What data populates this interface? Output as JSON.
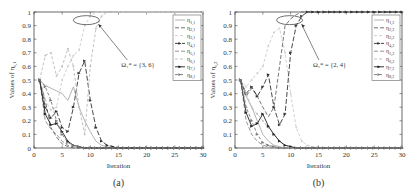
{
  "chart_data": [
    {
      "type": "line",
      "panel_label": "(a)",
      "xlabel": "Iteration",
      "ylabel": "Values of η_{i,1}",
      "xlim": [
        0,
        30
      ],
      "ylim": [
        0,
        1
      ],
      "xticks": [
        0,
        5,
        10,
        15,
        20,
        25,
        30
      ],
      "yticks": [
        0,
        0.1,
        0.2,
        0.3,
        0.4,
        0.5,
        0.6,
        0.7,
        0.8,
        0.9,
        1
      ],
      "grid": false,
      "legend_position": "upper right",
      "annotation": "Ω₁* = {3, 6}",
      "x": [
        1,
        2,
        3,
        4,
        5,
        6,
        7,
        8,
        9,
        10,
        11,
        12,
        13,
        14,
        15,
        16,
        17,
        18,
        19,
        20,
        21,
        22,
        23,
        24,
        25,
        26,
        27,
        28,
        29,
        30
      ],
      "series": [
        {
          "name": "η_{1,1}",
          "color": "#aaaaaa",
          "dash": "",
          "values": [
            0.5,
            0.46,
            0.44,
            0.42,
            0.4,
            0.35,
            0.45,
            0.3,
            0.2,
            0.12,
            0.05,
            0.02,
            0.01,
            0,
            0,
            0,
            0,
            0,
            0,
            0,
            0,
            0,
            0,
            0,
            0,
            0,
            0,
            0,
            0,
            0
          ]
        },
        {
          "name": "η_{2,1}",
          "color": "#666666",
          "dash": "4,2",
          "values": [
            0.5,
            0.35,
            0.15,
            0.08,
            0.03,
            0.01,
            0,
            0,
            0,
            0,
            0,
            0,
            0,
            0,
            0,
            0,
            0,
            0,
            0,
            0,
            0,
            0,
            0,
            0,
            0,
            0,
            0,
            0,
            0,
            0
          ]
        },
        {
          "name": "η_{3,1}",
          "color": "#cccccc",
          "dash": "3,2",
          "values": [
            0.5,
            0.35,
            0.28,
            0.3,
            0.5,
            0.6,
            0.68,
            0.72,
            0.9,
            0.97,
            1,
            1,
            1,
            1,
            1,
            1,
            1,
            1,
            1,
            1,
            1,
            1,
            1,
            1,
            1,
            1,
            1,
            1,
            1,
            1
          ]
        },
        {
          "name": "η_{4,1}",
          "color": "#333333",
          "dash": "5,2",
          "values": [
            0.5,
            0.3,
            0.22,
            0.27,
            0.15,
            0.12,
            0.3,
            0.55,
            0.64,
            0.35,
            0.15,
            0.05,
            0.02,
            0.01,
            0,
            0,
            0,
            0,
            0,
            0,
            0,
            0,
            0,
            0,
            0,
            0,
            0,
            0,
            0,
            0
          ]
        },
        {
          "name": "η_{5,1}",
          "color": "#888888",
          "dash": "4,2",
          "values": [
            0.5,
            0.2,
            0.14,
            0.1,
            0.05,
            0.02,
            0.01,
            0,
            0,
            0,
            0,
            0,
            0,
            0,
            0,
            0,
            0,
            0,
            0,
            0,
            0,
            0,
            0,
            0,
            0,
            0,
            0,
            0,
            0,
            0
          ]
        },
        {
          "name": "η_{6,1}",
          "color": "#bbbbbb",
          "dash": "3,2",
          "values": [
            0.5,
            0.68,
            0.7,
            0.53,
            0.6,
            0.73,
            0.6,
            0.3,
            0.1,
            0.6,
            0.88,
            0.97,
            1,
            1,
            1,
            1,
            1,
            1,
            1,
            1,
            1,
            1,
            1,
            1,
            1,
            1,
            1,
            1,
            1,
            1
          ]
        },
        {
          "name": "η_{7,1}",
          "color": "#222222",
          "dash": "",
          "values": [
            0.5,
            0.25,
            0.17,
            0.18,
            0.12,
            0.05,
            0.02,
            0.01,
            0,
            0,
            0,
            0,
            0,
            0,
            0,
            0,
            0,
            0,
            0,
            0,
            0,
            0,
            0,
            0,
            0,
            0,
            0,
            0,
            0,
            0
          ]
        },
        {
          "name": "η_{8,1}",
          "color": "#777777",
          "dash": "3,2",
          "values": [
            0.5,
            0.45,
            0.35,
            0.2,
            0.1,
            0.04,
            0.02,
            0.01,
            0,
            0,
            0,
            0,
            0,
            0,
            0,
            0,
            0,
            0,
            0,
            0,
            0,
            0,
            0,
            0,
            0,
            0,
            0,
            0,
            0,
            0
          ]
        }
      ]
    },
    {
      "type": "line",
      "panel_label": "(b)",
      "xlabel": "Iteration",
      "ylabel": "Values of η_{i,2}",
      "xlim": [
        0,
        30
      ],
      "ylim": [
        0,
        1
      ],
      "xticks": [
        0,
        5,
        10,
        15,
        20,
        25,
        30
      ],
      "yticks": [
        0,
        0.1,
        0.2,
        0.3,
        0.4,
        0.5,
        0.6,
        0.7,
        0.8,
        0.9,
        1
      ],
      "grid": false,
      "legend_position": "upper right",
      "annotation": "Ω₂* = {2, 4}",
      "x": [
        1,
        2,
        3,
        4,
        5,
        6,
        7,
        8,
        9,
        10,
        11,
        12,
        13,
        14,
        15,
        16,
        17,
        18,
        19,
        20,
        21,
        22,
        23,
        24,
        25,
        26,
        27,
        28,
        29,
        30
      ],
      "series": [
        {
          "name": "η_{1,2}",
          "color": "#aaaaaa",
          "dash": "",
          "values": [
            0.5,
            0.38,
            0.3,
            0.2,
            0.1,
            0.05,
            0.02,
            0.01,
            0,
            0,
            0,
            0,
            0,
            0,
            0,
            0,
            0,
            0,
            0,
            0,
            0,
            0,
            0,
            0,
            0,
            0,
            0,
            0,
            0,
            0
          ]
        },
        {
          "name": "η_{2,2}",
          "color": "#666666",
          "dash": "4,2",
          "values": [
            0.5,
            0.38,
            0.44,
            0.38,
            0.3,
            0.23,
            0.3,
            0.6,
            0.9,
            0.95,
            0.98,
            1,
            1,
            1,
            1,
            1,
            1,
            1,
            1,
            1,
            1,
            1,
            1,
            1,
            1,
            1,
            1,
            1,
            1,
            1
          ]
        },
        {
          "name": "η_{3,2}",
          "color": "#cccccc",
          "dash": "3,2",
          "values": [
            0.5,
            0.45,
            0.5,
            0.55,
            0.6,
            0.75,
            0.85,
            0.88,
            0.7,
            0.4,
            0.15,
            0.05,
            0.02,
            0.01,
            0,
            0,
            0,
            0,
            0,
            0,
            0,
            0,
            0,
            0,
            0,
            0,
            0,
            0,
            0,
            0
          ]
        },
        {
          "name": "η_{4,2}",
          "color": "#333333",
          "dash": "5,2",
          "values": [
            0.5,
            0.4,
            0.45,
            0.38,
            0.45,
            0.54,
            0.3,
            0.17,
            0.25,
            0.7,
            0.9,
            0.97,
            1,
            1,
            1,
            1,
            1,
            1,
            1,
            1,
            1,
            1,
            1,
            1,
            1,
            1,
            1,
            1,
            1,
            1
          ]
        },
        {
          "name": "η_{5,2}",
          "color": "#888888",
          "dash": "4,2",
          "values": [
            0.5,
            0.2,
            0.1,
            0.05,
            0.02,
            0.01,
            0,
            0,
            0,
            0,
            0,
            0,
            0,
            0,
            0,
            0,
            0,
            0,
            0,
            0,
            0,
            0,
            0,
            0,
            0,
            0,
            0,
            0,
            0,
            0
          ]
        },
        {
          "name": "η_{6,2}",
          "color": "#bbbbbb",
          "dash": "3,2",
          "values": [
            0.5,
            0.4,
            0.3,
            0.25,
            0.2,
            0.15,
            0.1,
            0.05,
            0.02,
            0.01,
            0,
            0,
            0,
            0,
            0,
            0,
            0,
            0,
            0,
            0,
            0,
            0,
            0,
            0,
            0,
            0,
            0,
            0,
            0,
            0
          ]
        },
        {
          "name": "η_{7,2}",
          "color": "#222222",
          "dash": "",
          "values": [
            0.5,
            0.26,
            0.16,
            0.18,
            0.25,
            0.16,
            0.1,
            0.05,
            0.02,
            0.01,
            0,
            0,
            0,
            0,
            0,
            0,
            0,
            0,
            0,
            0,
            0,
            0,
            0,
            0,
            0,
            0,
            0,
            0,
            0,
            0
          ]
        },
        {
          "name": "η_{8,2}",
          "color": "#777777",
          "dash": "3,2",
          "values": [
            0.5,
            0.3,
            0.2,
            0.1,
            0.04,
            0.02,
            0.01,
            0,
            0,
            0,
            0,
            0,
            0,
            0,
            0,
            0,
            0,
            0,
            0,
            0,
            0,
            0,
            0,
            0,
            0,
            0,
            0,
            0,
            0,
            0
          ]
        }
      ]
    }
  ]
}
